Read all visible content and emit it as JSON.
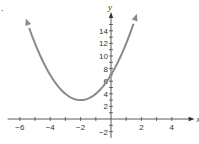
{
  "item_marker": ".",
  "chart_data": {
    "type": "line",
    "title": "",
    "xlabel": "x",
    "ylabel": "y",
    "xlim": [
      -6.8,
      5.5
    ],
    "ylim": [
      -3,
      17
    ],
    "x_ticks": [
      -6,
      -5,
      -4,
      -3,
      -2,
      -1,
      1,
      2,
      3,
      4
    ],
    "x_tick_labels": [
      {
        "value": -6,
        "label": "−6"
      },
      {
        "value": -4,
        "label": "−4"
      },
      {
        "value": -2,
        "label": "−2"
      },
      {
        "value": 2,
        "label": "2"
      },
      {
        "value": 4,
        "label": "4"
      }
    ],
    "y_ticks": [
      -2,
      -1,
      1,
      2,
      3,
      4,
      5,
      6,
      7,
      8,
      9,
      10,
      11,
      12,
      13,
      14,
      15
    ],
    "y_tick_labels": [
      {
        "value": -2,
        "label": "−2"
      },
      {
        "value": 2,
        "label": "2"
      },
      {
        "value": 4,
        "label": "4"
      },
      {
        "value": 6,
        "label": "6"
      },
      {
        "value": 8,
        "label": "8"
      },
      {
        "value": 10,
        "label": "10"
      },
      {
        "value": 12,
        "label": "12"
      },
      {
        "value": 14,
        "label": "14"
      }
    ],
    "grid": false,
    "series": [
      {
        "name": "parabola",
        "equation": "y = (x + 2)^2 + 3",
        "vertex": [
          -2,
          3
        ],
        "y_intercept": 7,
        "x_range": [
          -5.6,
          1.7
        ],
        "color": "#8a8a8a",
        "arrows_at_ends": true
      }
    ]
  }
}
